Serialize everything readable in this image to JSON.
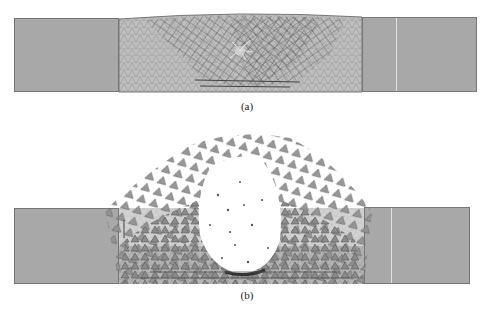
{
  "figure": {
    "panels": [
      {
        "id": "a",
        "caption": "(a)",
        "description": "Simulation of rock mass between two support blocks; deformed triangular element mesh with crack zone in middle region"
      },
      {
        "id": "b",
        "caption": "(b)",
        "description": "Later stage: ejected triangular fragments forming a mound above middle region with a central void of scattered particles"
      }
    ],
    "colors": {
      "block_fill": "#a8a8a8",
      "block_border": "#777777",
      "mesh_fill": "#b9b9b9",
      "element_dark": "#555555",
      "fragment_fill": "#8e8e8e",
      "background": "#ffffff"
    }
  }
}
